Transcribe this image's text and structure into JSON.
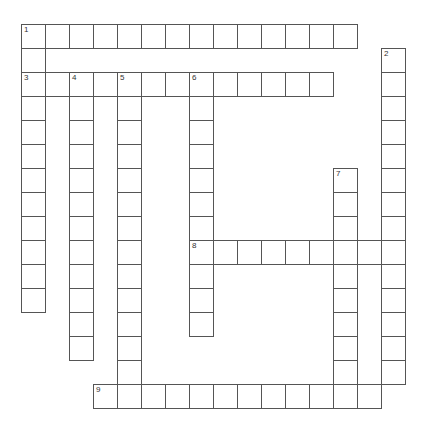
{
  "puzzle": {
    "type": "crossword",
    "entries": [
      {
        "number": 1,
        "direction": "across",
        "row": 0,
        "col": 0,
        "length": 14
      },
      {
        "number": 1,
        "direction": "down",
        "row": 0,
        "col": 0,
        "length": 12
      },
      {
        "number": 2,
        "direction": "down",
        "row": 1,
        "col": 15,
        "length": 14
      },
      {
        "number": 3,
        "direction": "across",
        "row": 2,
        "col": 0,
        "length": 13
      },
      {
        "number": 4,
        "direction": "down",
        "row": 2,
        "col": 2,
        "length": 12
      },
      {
        "number": 5,
        "direction": "down",
        "row": 2,
        "col": 4,
        "length": 14
      },
      {
        "number": 6,
        "direction": "down",
        "row": 2,
        "col": 7,
        "length": 11
      },
      {
        "number": 7,
        "direction": "down",
        "row": 6,
        "col": 13,
        "length": 10
      },
      {
        "number": 8,
        "direction": "across",
        "row": 9,
        "col": 7,
        "length": 9
      },
      {
        "number": 9,
        "direction": "across",
        "row": 15,
        "col": 3,
        "length": 12
      }
    ],
    "clue_numbers": [
      {
        "number": "1",
        "row": 0,
        "col": 0
      },
      {
        "number": "2",
        "row": 1,
        "col": 15
      },
      {
        "number": "3",
        "row": 2,
        "col": 0
      },
      {
        "number": "4",
        "row": 2,
        "col": 2
      },
      {
        "number": "5",
        "row": 2,
        "col": 4
      },
      {
        "number": "6",
        "row": 2,
        "col": 7
      },
      {
        "number": "7",
        "row": 6,
        "col": 13
      },
      {
        "number": "8",
        "row": 9,
        "col": 7
      },
      {
        "number": "9",
        "row": 15,
        "col": 3
      }
    ]
  }
}
